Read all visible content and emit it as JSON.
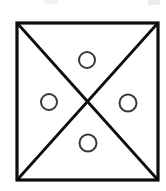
{
  "figure": {
    "background_color": "#ffffff",
    "canvas": {
      "width": 166,
      "height": 191
    }
  },
  "square": {
    "label": "outer-square",
    "x": 17,
    "y": 23,
    "width": 141,
    "height": 157,
    "stroke_color": "#0d0d0d",
    "stroke_width": 3.2,
    "fill": "none"
  },
  "diagonals": [
    {
      "label": "diagonal-top-left-to-bottom-right",
      "x1": 18,
      "y1": 24,
      "x2": 157,
      "y2": 179,
      "stroke_color": "#0d0d0d",
      "stroke_width": 2.8
    },
    {
      "label": "diagonal-top-right-to-bottom-left",
      "x1": 157,
      "y1": 24,
      "x2": 18,
      "y2": 179,
      "stroke_color": "#0d0d0d",
      "stroke_width": 2.8
    }
  ],
  "intersection": {
    "label": "diagonal-intersection-center",
    "x": 87.5,
    "y": 101.5
  },
  "circles": [
    {
      "label": "circle-top",
      "region": "top-triangle",
      "cx": 87,
      "cy": 60,
      "r": 8,
      "stroke_color": "#3a3a3a",
      "stroke_width": 2,
      "fill": "none"
    },
    {
      "label": "circle-left",
      "region": "left-triangle",
      "cx": 49,
      "cy": 102,
      "r": 8,
      "stroke_color": "#3a3a3a",
      "stroke_width": 2,
      "fill": "none"
    },
    {
      "label": "circle-right",
      "region": "right-triangle",
      "cx": 128,
      "cy": 103,
      "r": 8.5,
      "stroke_color": "#3a3a3a",
      "stroke_width": 2,
      "fill": "none"
    },
    {
      "label": "circle-bottom",
      "region": "bottom-triangle",
      "cx": 88,
      "cy": 143,
      "r": 8.5,
      "stroke_color": "#3a3a3a",
      "stroke_width": 2,
      "fill": "none"
    }
  ],
  "scan_artifacts": [
    {
      "label": "artifact-top-left",
      "x": 44,
      "y": 0,
      "width": 14,
      "height": 4,
      "color": "#f2f2f2"
    },
    {
      "label": "artifact-top-right",
      "x": 148,
      "y": 0,
      "width": 12,
      "height": 5,
      "color": "#ececec"
    }
  ]
}
